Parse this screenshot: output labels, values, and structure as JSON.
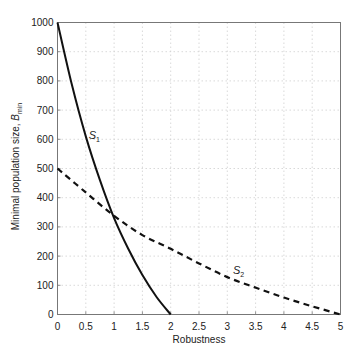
{
  "chart_data": {
    "type": "line",
    "title": "",
    "xlabel": "Robustness",
    "ylabel": "Minimal population size, ",
    "ylabel_var": "B",
    "ylabel_sub": "min",
    "xlim": [
      0,
      5
    ],
    "ylim": [
      0,
      1000
    ],
    "grid": true,
    "xticks": [
      0,
      0.5,
      1,
      1.5,
      2,
      2.5,
      3,
      3.5,
      4,
      4.5,
      5
    ],
    "xtick_labels": [
      "0",
      "0.5",
      "1",
      "1.5",
      "2",
      "2.5",
      "3",
      "3.5",
      "4",
      "4.5",
      "5"
    ],
    "yticks": [
      0,
      100,
      200,
      300,
      400,
      500,
      600,
      700,
      800,
      900,
      1000
    ],
    "ytick_labels": [
      "0",
      "100",
      "200",
      "300",
      "400",
      "500",
      "600",
      "700",
      "800",
      "900",
      "1000"
    ],
    "series": [
      {
        "name": "S1",
        "label_main": "S",
        "label_sub": "1",
        "style": "solid",
        "color": "#111111",
        "x": [
          0,
          0.25,
          0.5,
          0.75,
          1.0,
          1.25,
          1.5,
          1.75,
          2.0
        ],
        "y": [
          1000,
          790,
          610,
          460,
          330,
          225,
          135,
          60,
          0
        ],
        "label_at": [
          0.55,
          600
        ]
      },
      {
        "name": "S2",
        "label_main": "S",
        "label_sub": "2",
        "style": "dashed",
        "color": "#111111",
        "x": [
          0,
          0.5,
          1.0,
          1.5,
          2.0,
          2.5,
          3.0,
          3.5,
          4.0,
          4.5,
          5.0
        ],
        "y": [
          500,
          418,
          338,
          272,
          225,
          175,
          128,
          92,
          58,
          28,
          0
        ],
        "label_at": [
          3.1,
          140
        ]
      }
    ]
  }
}
